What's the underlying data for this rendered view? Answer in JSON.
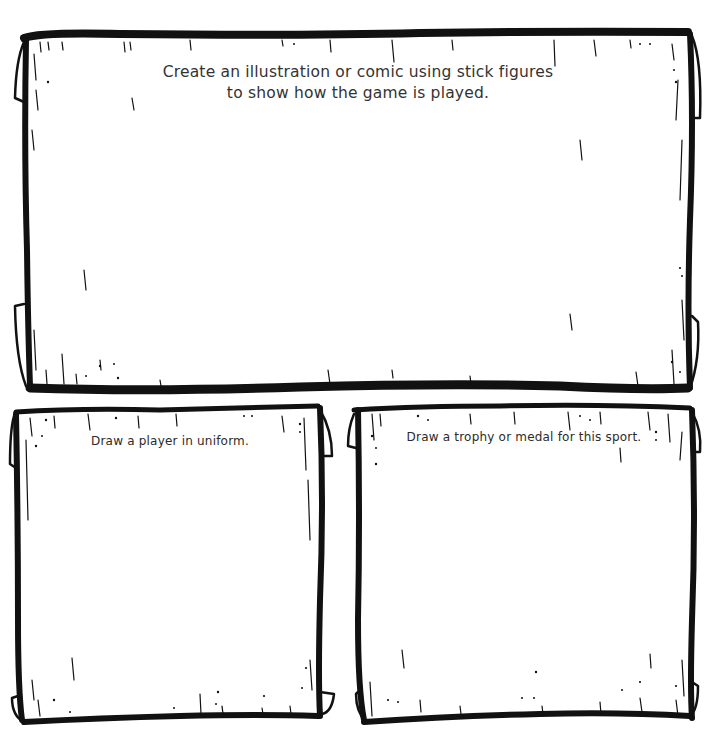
{
  "worksheet": {
    "panels": [
      {
        "id": "comic",
        "prompt_lines": [
          "Create an illustration or comic using stick figures",
          "to show how the game is played."
        ]
      },
      {
        "id": "player",
        "prompt": "Draw a player in uniform."
      },
      {
        "id": "trophy",
        "prompt": "Draw a trophy or medal for this sport."
      }
    ],
    "style": {
      "ink_color": "#111111",
      "paper_color": "#ffffff",
      "text_color": "#333333"
    }
  }
}
